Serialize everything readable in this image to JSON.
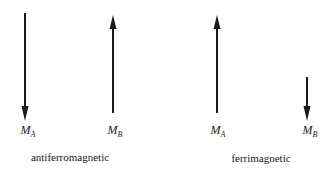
{
  "panels": [
    {
      "caption": "antiferromagnetic",
      "arrows": [
        {
          "label_main": "M",
          "label_sub": "A",
          "direction": "down",
          "length": "long"
        },
        {
          "label_main": "M",
          "label_sub": "B",
          "direction": "up",
          "length": "long"
        }
      ]
    },
    {
      "caption": "ferrimagnetic",
      "arrows": [
        {
          "label_main": "M",
          "label_sub": "A",
          "direction": "up",
          "length": "long"
        },
        {
          "label_main": "M",
          "label_sub": "B",
          "direction": "down",
          "length": "short"
        }
      ]
    }
  ],
  "colors": {
    "arrow": "#1a1a1a",
    "background": "#ffffff"
  }
}
